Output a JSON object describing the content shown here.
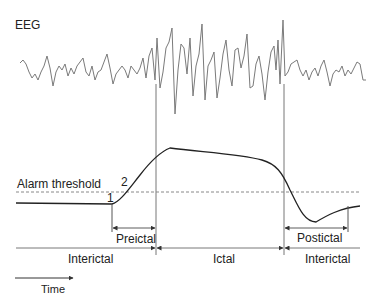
{
  "signal_label": "EEG",
  "threshold_label": "Alarm threshold",
  "markers": {
    "m1": "1",
    "m2": "2"
  },
  "phases": {
    "preictal": "Preictal",
    "ictal": "Ictal",
    "postictal": "Postictal",
    "interictal_left": "Interictal",
    "interictal_right": "Interictal"
  },
  "time_axis_label": "Time",
  "colors": {
    "eeg_trace": "#7a7a7a",
    "curve": "#222222",
    "threshold": "#888888",
    "lines": "#777777"
  }
}
